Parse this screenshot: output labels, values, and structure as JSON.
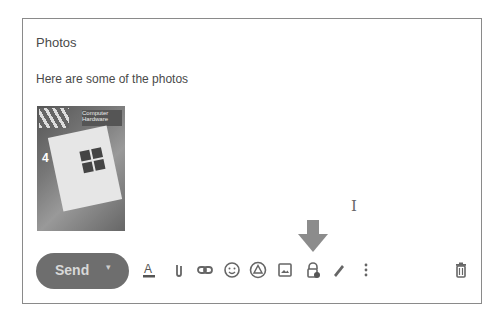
{
  "compose": {
    "subject": "Photos",
    "body": "Here are some of the photos",
    "attachment_image": "photo of open Computer Hardware book",
    "cover_text": "Computer Hardware"
  },
  "toolbar": {
    "send_label": "Send",
    "send_dropdown": "▾",
    "icons": [
      "text-format-icon",
      "attach-icon",
      "link-icon",
      "emoji-icon",
      "drive-icon",
      "photo-icon",
      "confidential-mode-icon",
      "signature-icon",
      "more-options-icon",
      "discard-icon"
    ]
  },
  "annotation": {
    "arrow_target": "confidential-mode-icon",
    "arrow_color": "#8c8c8c"
  },
  "colors": {
    "send_bg": "#6e6e6e",
    "frame_border": "#8a8a8a"
  }
}
